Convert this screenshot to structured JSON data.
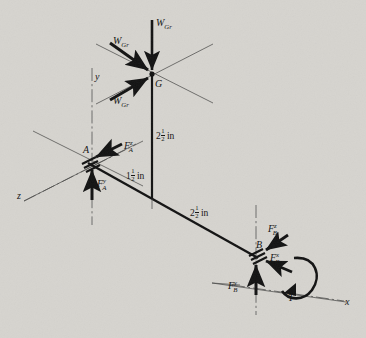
{
  "figure": {
    "type": "free-body-diagram",
    "background_color": "#d6d4cf",
    "ink_color": "#111111",
    "axes": [
      {
        "name": "y",
        "label": "y"
      },
      {
        "name": "z",
        "label": "z"
      },
      {
        "name": "x",
        "label": "x"
      }
    ],
    "points": [
      {
        "id": "G",
        "label": "G",
        "description": "gear center"
      },
      {
        "id": "A",
        "label": "A",
        "description": "bearing support A"
      },
      {
        "id": "B",
        "label": "B",
        "description": "bearing support B"
      }
    ],
    "forces": [
      {
        "id": "WGr-top",
        "label_base": "W",
        "label_sub": "Gr",
        "at": "G",
        "direction": "down"
      },
      {
        "id": "WGr-upper",
        "label_base": "W",
        "label_sub": "Gr",
        "at": "G",
        "direction": "down-right"
      },
      {
        "id": "WGr-lower",
        "label_base": "W",
        "label_sub": "Gr",
        "at": "G",
        "direction": "up-right"
      },
      {
        "id": "FAz",
        "label_base": "F",
        "label_sub": "A",
        "label_sup": "z",
        "at": "A",
        "direction": "left"
      },
      {
        "id": "FAy",
        "label_base": "F",
        "label_sub": "A",
        "label_sup": "y",
        "at": "A",
        "direction": "up"
      },
      {
        "id": "FBz",
        "label_base": "F",
        "label_sub": "B",
        "label_sup": "z",
        "at": "B",
        "direction": "down-left"
      },
      {
        "id": "FBx",
        "label_base": "F",
        "label_sub": "B",
        "label_sup": "x",
        "at": "B",
        "direction": "left"
      },
      {
        "id": "FBy",
        "label_base": "F",
        "label_sub": "B",
        "label_sup": "y",
        "at": "B",
        "direction": "up"
      }
    ],
    "torque": {
      "id": "T",
      "label": "T",
      "at": "B",
      "description": "applied torque about x-axis"
    },
    "dimensions": [
      {
        "id": "dim-G-shaft",
        "whole": "2",
        "num": "1",
        "den": "2",
        "unit": "in",
        "text": "2 1/2 in",
        "between": "G to shaft"
      },
      {
        "id": "dim-A-offset",
        "whole": "1",
        "num": "1",
        "den": "2",
        "unit": "in",
        "text": "1 1/2 in",
        "between": "A to gear plane"
      },
      {
        "id": "dim-A-B",
        "whole": "2",
        "num": "1",
        "den": "2",
        "unit": "in",
        "text": "2 1/2 in",
        "between": "gear plane to B"
      }
    ]
  }
}
